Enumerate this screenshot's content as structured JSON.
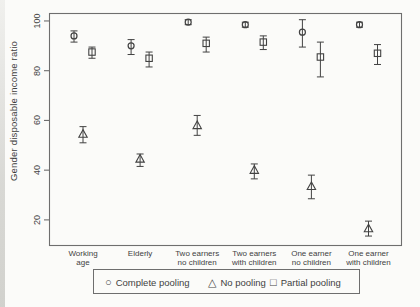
{
  "chart_data": {
    "type": "scatter",
    "title": "",
    "ylabel": "Gender disposable income ratio",
    "xlabel": "",
    "ylim": [
      9.5,
      103.2
    ],
    "yticks": [
      20,
      40,
      60,
      80,
      100
    ],
    "grid": "off",
    "error_bars": true,
    "legend_position": "bottom",
    "categories": [
      "Working\nage",
      "Elderly",
      "Two earners\nno children",
      "Two earners\nwith children",
      "One earner\nno children",
      "One earner\nwith children"
    ],
    "series": [
      {
        "name": "Complete pooling",
        "marker": "circle",
        "glyph": "○",
        "offset": -9,
        "values": [
          94,
          90,
          99.5,
          98.5,
          95.5,
          98.5
        ],
        "ci_low": [
          91.5,
          86.5,
          98.5,
          97.5,
          89.5,
          97.5
        ],
        "ci_high": [
          96,
          92.5,
          100.5,
          99.5,
          100.5,
          99.5
        ]
      },
      {
        "name": "No pooling",
        "marker": "triangle",
        "glyph": "△",
        "offset": 0,
        "values": [
          54.5,
          44.5,
          58,
          40,
          33.5,
          16.5
        ],
        "ci_low": [
          51,
          41.5,
          54,
          36.5,
          28.5,
          13.5
        ],
        "ci_high": [
          57.5,
          46.5,
          62,
          42.5,
          38,
          19.5
        ]
      },
      {
        "name": "Partial pooling",
        "marker": "square",
        "glyph": "□",
        "offset": 9,
        "values": [
          87.5,
          85,
          91,
          91.5,
          85.5,
          87
        ],
        "ci_low": [
          85,
          81.5,
          87.5,
          88.5,
          77.5,
          82.5
        ],
        "ci_high": [
          89.5,
          87.5,
          93.5,
          94,
          91.5,
          90.5
        ]
      }
    ],
    "colors": {
      "ink": "#424242",
      "frame": "#6e6e6e",
      "paper": "#fbfbf9"
    }
  }
}
